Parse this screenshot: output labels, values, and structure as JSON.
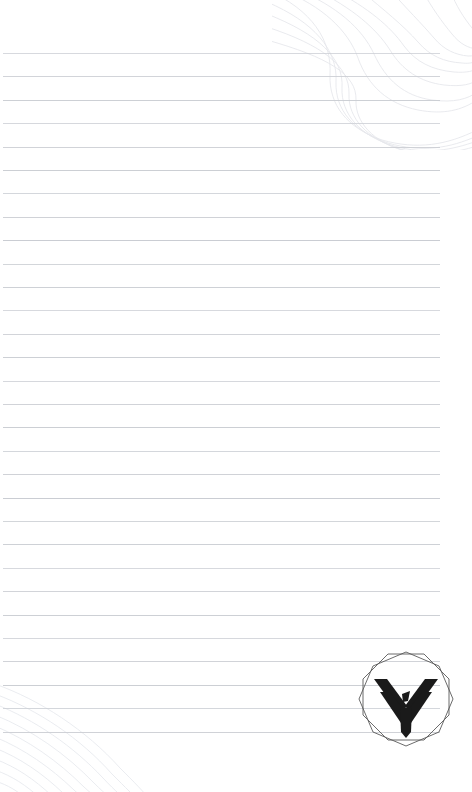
{
  "page": {
    "width": 472,
    "height": 792,
    "background_color": "#ffffff",
    "content_text": ""
  },
  "ruling": {
    "line_color": "#c9ccd2",
    "line_count": 30,
    "first_line_y": 53,
    "line_spacing": 23.4,
    "line_start_x": 3,
    "line_end_x": 440,
    "line_thickness": 1
  },
  "decoration": {
    "topo_line_color": "#e6e8ec",
    "top_right": {
      "name": "topographic-contours-top-right",
      "description": "faint topographic contour curves"
    },
    "bottom_left": {
      "name": "topographic-contours-bottom-left",
      "description": "faint concentric arc contours"
    }
  },
  "logo": {
    "name": "chevron-bird-emblem",
    "emblem_color": "#1a1a1a",
    "outline_color": "#5a5a5a",
    "shape": "double-octagon",
    "alt_text": "Chevron bird emblem inside double octagon",
    "x": 354,
    "y": 648,
    "size": 104
  }
}
